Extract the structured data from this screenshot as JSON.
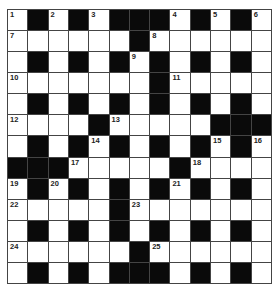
{
  "puzzle": {
    "rows": 13,
    "cols": 13,
    "colors": {
      "block": "#0a0a0a",
      "cell": "#ffffff",
      "border": "#444444",
      "number": "#222222"
    },
    "layout": [
      "#.#.#.###.#.#",
      "......#......",
      "#.#.#.#.#.#.#",
      ".......#.....",
      "#.#.#.#.#.#.#",
      "....#.....###",
      "#.#.#.#.#.#.#",
      "###.....#....",
      "#.#.#.#.#.#.#",
      ".....#.......",
      "#.#.#.#.#.#.#",
      "......#......",
      "#.#.#.###.#.#"
    ],
    "grid": [
      [
        "1",
        "#",
        "2",
        "#",
        "3",
        "#",
        "#",
        "#",
        "4",
        "#",
        "5",
        "#",
        "6"
      ],
      [
        "7",
        "",
        "",
        "",
        "",
        "",
        "#",
        "8",
        "",
        "",
        "",
        "",
        ""
      ],
      [
        "",
        "#",
        "",
        "#",
        "",
        "#",
        "9",
        "#",
        "",
        "#",
        "",
        "#",
        ""
      ],
      [
        "10",
        "",
        "",
        "",
        "",
        "",
        "",
        "#",
        "11",
        "",
        "",
        "",
        ""
      ],
      [
        "",
        "#",
        "",
        "#",
        "",
        "#",
        "",
        "#",
        "",
        "#",
        "",
        "#",
        ""
      ],
      [
        "12",
        "",
        "",
        "",
        "#",
        "13",
        "",
        "",
        "",
        "",
        "#",
        "#",
        "#"
      ],
      [
        "",
        "#",
        "",
        "#",
        "14",
        "#",
        "",
        "#",
        "",
        "#",
        "15",
        "#",
        "16"
      ],
      [
        "#",
        "#",
        "#",
        "17",
        "",
        "",
        "",
        "",
        "#",
        "18",
        "",
        "",
        ""
      ],
      [
        "19",
        "#",
        "20",
        "#",
        "",
        "#",
        "",
        "#",
        "21",
        "#",
        "",
        "#",
        ""
      ],
      [
        "22",
        "",
        "",
        "",
        "",
        "#",
        "23",
        "",
        "",
        "",
        "",
        "",
        ""
      ],
      [
        "",
        "#",
        "",
        "#",
        "",
        "#",
        "",
        "#",
        "",
        "#",
        "",
        "#",
        ""
      ],
      [
        "24",
        "",
        "",
        "",
        "",
        "",
        "#",
        "25",
        "",
        "",
        "",
        "",
        ""
      ],
      [
        "",
        "#",
        "",
        "#",
        "",
        "#",
        "#",
        "#",
        "",
        "#",
        "",
        "#",
        ""
      ]
    ],
    "clue_numbers": [
      "1",
      "2",
      "3",
      "4",
      "5",
      "6",
      "7",
      "8",
      "9",
      "10",
      "11",
      "12",
      "13",
      "14",
      "15",
      "16",
      "17",
      "18",
      "19",
      "20",
      "21",
      "22",
      "23",
      "24",
      "25"
    ]
  }
}
